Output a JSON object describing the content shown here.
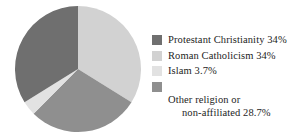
{
  "chart_data": {
    "type": "pie",
    "title": "",
    "categories": [
      "Protestant Christianity",
      "Roman Catholicism",
      "Islam",
      "Other religion or non-affiliated"
    ],
    "values": [
      34,
      34,
      3.7,
      28.7
    ],
    "value_labels": [
      "34%",
      "34%",
      "3.7%",
      "28.7%"
    ],
    "colors": [
      "#6f6f6f",
      "#d2d2d2",
      "#e2e2e2",
      "#8f8f8f"
    ],
    "legend_position": "right",
    "grid": false,
    "start_angle_deg": 0,
    "direction": "clockwise",
    "xlabel": "",
    "ylabel": ""
  },
  "legend": {
    "items": [
      {
        "swatch_name": "protestant-christianity",
        "color": "#6f6f6f",
        "line1": "Protestant Christianity 34%",
        "line2": ""
      },
      {
        "swatch_name": "roman-catholicism",
        "color": "#d2d2d2",
        "line1": "Roman Catholicism 34%",
        "line2": ""
      },
      {
        "swatch_name": "islam",
        "color": "#e2e2e2",
        "line1": "Islam 3.7%",
        "line2": ""
      },
      {
        "swatch_name": "other-religion-or-non-affiliated",
        "color": "#8f8f8f",
        "line1": "Other religion or",
        "line2": "non-affiliated 28.7%"
      }
    ]
  }
}
